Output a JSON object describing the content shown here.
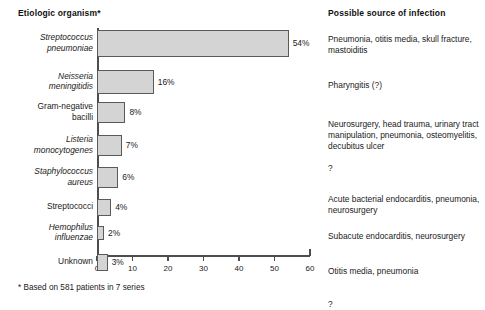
{
  "headers": {
    "left": "Etiologic organism*",
    "right": "Possible source of infection"
  },
  "footnote": "* Based on 581 patients in 7 series",
  "axis": {
    "ticks": [
      "0",
      "10",
      "20",
      "30",
      "40",
      "50",
      "60"
    ]
  },
  "rows": [
    {
      "organism_line1": "Streptococcus",
      "organism_line2": "pneumoniae",
      "italic": true,
      "value": 54,
      "value_label": "54%",
      "source": "Pneumonia, otitis media, skull fracture, mastoiditis"
    },
    {
      "organism_line1": "Neisseria",
      "organism_line2": "meningitidis",
      "italic": true,
      "value": 16,
      "value_label": "16%",
      "source": "Pharyngitis (?)"
    },
    {
      "organism_line1": "Gram-negative",
      "organism_line2": "bacilli",
      "italic": false,
      "value": 8,
      "value_label": "8%",
      "source": "Neurosurgery, head trauma, urinary tract manipulation, pneumonia, osteomyelitis, decubitus ulcer"
    },
    {
      "organism_line1": "Listeria",
      "organism_line2": "monocytogenes",
      "italic": true,
      "value": 7,
      "value_label": "7%",
      "source": "?"
    },
    {
      "organism_line1": "Staphylococcus",
      "organism_line2": "aureus",
      "italic": true,
      "value": 6,
      "value_label": "6%",
      "source": "Acute bacterial endocarditis, pneumonia, neurosurgery"
    },
    {
      "organism_line1": "Streptococci",
      "organism_line2": "",
      "italic": false,
      "value": 4,
      "value_label": "4%",
      "source": "Subacute endocarditis, neurosurgery"
    },
    {
      "organism_line1": "Hemophilus",
      "organism_line2": "influenzae",
      "italic": true,
      "value": 2,
      "value_label": "2%",
      "source": "Otitis media, pneumonia"
    },
    {
      "organism_line1": "Unknown",
      "organism_line2": "",
      "italic": false,
      "value": 3,
      "value_label": "3%",
      "source": "?"
    }
  ],
  "chart_data": {
    "type": "bar",
    "orientation": "horizontal",
    "title": "Etiologic organism*",
    "xlabel": "",
    "ylabel": "",
    "xlim": [
      0,
      60
    ],
    "grid": false,
    "legend": "none",
    "categories": [
      "Streptococcus pneumoniae",
      "Neisseria meningitidis",
      "Gram-negative bacilli",
      "Listeria monocytogenes",
      "Staphylococcus aureus",
      "Streptococci",
      "Hemophilus influenzae",
      "Unknown"
    ],
    "values": [
      54,
      16,
      8,
      7,
      6,
      4,
      2,
      3
    ],
    "data_labels": [
      "54%",
      "16%",
      "8%",
      "7%",
      "6%",
      "4%",
      "2%",
      "3%"
    ],
    "xticks": [
      0,
      10,
      20,
      30,
      40,
      50,
      60
    ],
    "annotations": [
      "* Based on 581 patients in 7 series"
    ],
    "bar_fill": "#d4d4d4",
    "bar_stroke": "#5a5a5a"
  }
}
